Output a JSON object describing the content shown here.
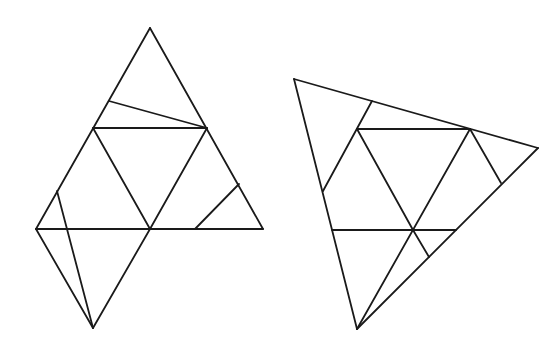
{
  "diagram": {
    "type": "geometric-figures",
    "stroke_color": "#1a1a1a",
    "background": "#ffffff",
    "figures": [
      {
        "name": "left-figure",
        "points": {
          "apex": [
            150,
            28
          ],
          "upper_left_side": [
            109,
            101
          ],
          "mid_left": [
            93,
            128
          ],
          "mid_right": [
            207,
            128
          ],
          "lower_left_side": [
            57,
            191
          ],
          "base_left": [
            36,
            229
          ],
          "center": [
            150,
            229
          ],
          "right_side": [
            239,
            184
          ],
          "base_inner": [
            195,
            229
          ],
          "base_right": [
            263,
            229
          ],
          "bottom": [
            93,
            328
          ]
        },
        "segments": [
          [
            "apex",
            "base_left"
          ],
          [
            "apex",
            "base_right"
          ],
          [
            "base_left",
            "base_right"
          ],
          [
            "upper_left_side",
            "mid_right"
          ],
          [
            "mid_left",
            "mid_right"
          ],
          [
            "mid_left",
            "center"
          ],
          [
            "mid_right",
            "center"
          ],
          [
            "right_side",
            "base_inner"
          ],
          [
            "base_left",
            "bottom"
          ],
          [
            "center",
            "bottom"
          ],
          [
            "lower_left_side",
            "bottom"
          ]
        ]
      },
      {
        "name": "right-figure",
        "points": {
          "top_left": [
            294,
            79
          ],
          "top_side": [
            372,
            101
          ],
          "inner_left": [
            357,
            129
          ],
          "inner_right": [
            470,
            129
          ],
          "right": [
            538,
            148
          ],
          "left_side": [
            323,
            191
          ],
          "right_side": [
            501,
            183
          ],
          "mid_left": [
            332,
            230
          ],
          "center": [
            413,
            230
          ],
          "mid_right": [
            456,
            230
          ],
          "lower": [
            429,
            257
          ],
          "bottom": [
            357,
            329
          ]
        },
        "segments": [
          [
            "top_left",
            "right"
          ],
          [
            "top_left",
            "bottom"
          ],
          [
            "right",
            "bottom"
          ],
          [
            "top_side",
            "left_side"
          ],
          [
            "inner_left",
            "inner_right"
          ],
          [
            "inner_left",
            "center"
          ],
          [
            "inner_right",
            "bottom"
          ],
          [
            "inner_right",
            "right_side"
          ],
          [
            "mid_left",
            "mid_right"
          ],
          [
            "center",
            "lower"
          ]
        ]
      }
    ]
  }
}
